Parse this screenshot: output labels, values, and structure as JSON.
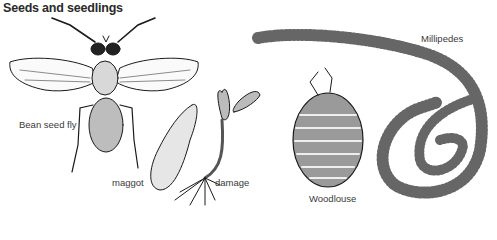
{
  "title": "Seeds and seedlings",
  "labels": {
    "bean_seed_fly": "Bean seed fly",
    "maggot": "maggot",
    "damage": "damage",
    "woodlouse": "Woodlouse",
    "millipedes": "Millipedes"
  },
  "colors": {
    "ink": "#1a1a1a",
    "text": "#3a3a3a",
    "background": "#ffffff"
  }
}
